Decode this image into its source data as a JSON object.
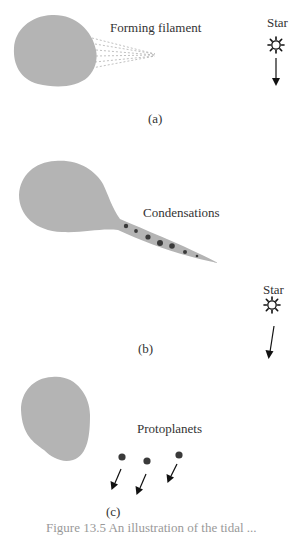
{
  "figure": {
    "panels": [
      {
        "id": "a",
        "panel_label": "(a)",
        "annotation": "Forming filament",
        "star_label": "Star"
      },
      {
        "id": "b",
        "panel_label": "(b)",
        "annotation": "Condensations",
        "star_label": "Star"
      },
      {
        "id": "c",
        "panel_label": "(c)",
        "annotation": "Protoplanets"
      }
    ],
    "caption": "Figure 13.5  An illustration of the tidal ..."
  },
  "colors": {
    "cloud": "#b4b4b4",
    "condensation": "#3a3a3a",
    "ink": "#111111",
    "filament_dashes": "#b0b0b0"
  }
}
